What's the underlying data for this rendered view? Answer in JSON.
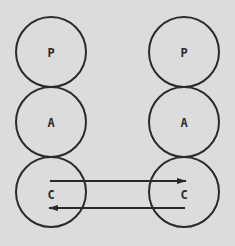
{
  "diagram": {
    "background": "#dcdcdc",
    "stroke": "#2a2a2a",
    "left_column": [
      "P",
      "A",
      "C"
    ],
    "right_column": [
      "P",
      "A",
      "C"
    ],
    "arrows": [
      {
        "from": "left C",
        "to": "right C",
        "direction": "right"
      },
      {
        "from": "right C",
        "to": "left C",
        "direction": "left"
      }
    ]
  }
}
